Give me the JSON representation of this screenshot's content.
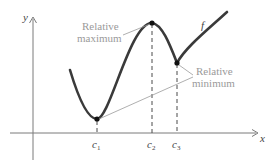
{
  "diagram": {
    "axes": {
      "x_label": "x",
      "y_label": "y"
    },
    "function_label": "f",
    "annotations": {
      "max_line1": "Relative",
      "max_line2": "maximum",
      "min_line1": "Relative",
      "min_line2": "minimum"
    },
    "critical_points": [
      {
        "label": "c",
        "sub": "1",
        "type": "relative minimum"
      },
      {
        "label": "c",
        "sub": "2",
        "type": "relative maximum"
      },
      {
        "label": "c",
        "sub": "3",
        "type": "relative minimum"
      }
    ],
    "colors": {
      "curve": "#3a3a3a",
      "annotation": "#9a9a9a",
      "axis": "#7a7a7a"
    }
  }
}
